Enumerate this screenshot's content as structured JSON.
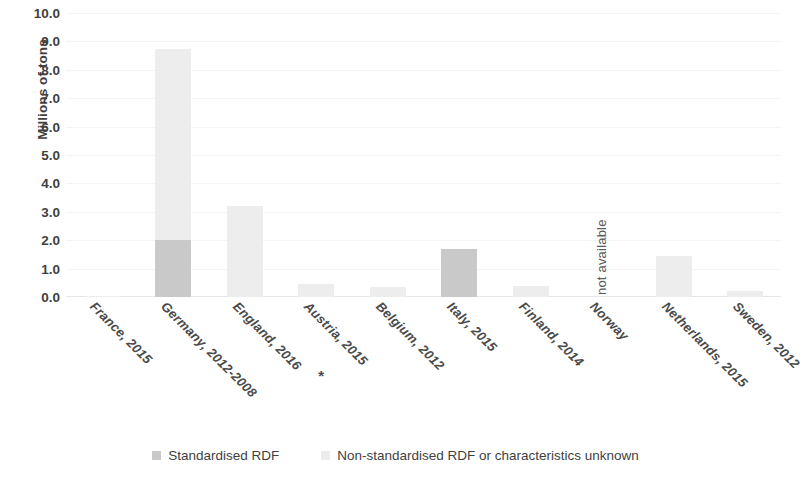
{
  "chart_data": {
    "type": "bar",
    "subtype": "stacked-bar",
    "title": "",
    "xlabel": "",
    "ylabel": "Millions of tons",
    "ylim": [
      0,
      10
    ],
    "ytick_step": 1,
    "ytick_labels": [
      "10.0",
      "9.0",
      "8.0",
      "7.0",
      "6.0",
      "5.0",
      "4.0",
      "3.0",
      "2.0",
      "1.0",
      "0.0"
    ],
    "ytick_values": [
      10,
      9,
      8,
      7,
      6,
      5,
      4,
      3,
      2,
      1,
      0
    ],
    "grid": true,
    "legend_position": "bottom",
    "categories": [
      "France, 2015",
      "Germany, 2012-2008",
      "England, 2016",
      "Austria, 2015",
      "Belgium, 2012",
      "Italy, 2015",
      "Finland, 2014",
      "Norway",
      "Netherlands, 2015",
      "Sweden, 2012"
    ],
    "series": [
      {
        "name": "Standardised RDF",
        "color": "#c9c9c9",
        "values": [
          0,
          2.0,
          0,
          0,
          0,
          1.7,
          0,
          null,
          0,
          0
        ]
      },
      {
        "name": "Non-standardised RDF or characteristics unknown",
        "color": "#ededed",
        "values": [
          0.05,
          6.75,
          3.2,
          0.45,
          0.35,
          0,
          0.4,
          null,
          1.45,
          0.2
        ]
      }
    ],
    "annotations": [
      {
        "text": "not available",
        "category": "Norway",
        "orientation": "vertical"
      },
      {
        "text": "*",
        "category": "Austria, 2015",
        "note": "asterisk footnote marker below axis label"
      }
    ]
  },
  "legend": {
    "items": [
      {
        "label": "Standardised RDF",
        "swatch": "legend-swatch-standardised"
      },
      {
        "label": "Non-standardised RDF or characteristics unknown",
        "swatch": "legend-swatch-non-standardised"
      }
    ]
  }
}
